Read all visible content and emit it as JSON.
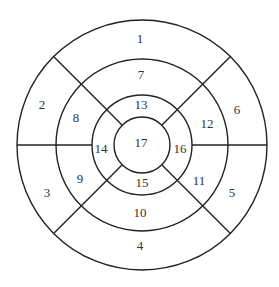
{
  "diagram": {
    "type": "bullseye-17-segment",
    "center": [
      142,
      145
    ],
    "radii": [
      125,
      86,
      50,
      28
    ],
    "segments": [
      {
        "id": "1",
        "label": "1",
        "x": 140,
        "y": 40
      },
      {
        "id": "2",
        "label": "2",
        "x": 42,
        "y": 106
      },
      {
        "id": "3",
        "label": "3",
        "x": 47,
        "y": 194
      },
      {
        "id": "4",
        "label": "4",
        "x": 140,
        "y": 247
      },
      {
        "id": "5",
        "label": "5",
        "x": 232,
        "y": 194
      },
      {
        "id": "6",
        "label": "6",
        "x": 237,
        "y": 111
      },
      {
        "id": "7",
        "label": "7",
        "x": 141,
        "y": 76
      },
      {
        "id": "8",
        "label": "8",
        "x": 76,
        "y": 119
      },
      {
        "id": "9",
        "label": "9",
        "x": 80,
        "y": 180
      },
      {
        "id": "10",
        "label": "10",
        "x": 140,
        "y": 214
      },
      {
        "id": "11",
        "label": "11",
        "x": 199,
        "y": 182
      },
      {
        "id": "12",
        "label": "12",
        "x": 207,
        "y": 125
      },
      {
        "id": "13",
        "label": "13",
        "x": 141,
        "y": 106
      },
      {
        "id": "14",
        "label": "14",
        "x": 101,
        "y": 150
      },
      {
        "id": "15",
        "label": "15",
        "x": 142,
        "y": 184
      },
      {
        "id": "16",
        "label": "16",
        "x": 180,
        "y": 150
      },
      {
        "id": "17",
        "label": "17",
        "x": 141,
        "y": 144
      }
    ]
  }
}
